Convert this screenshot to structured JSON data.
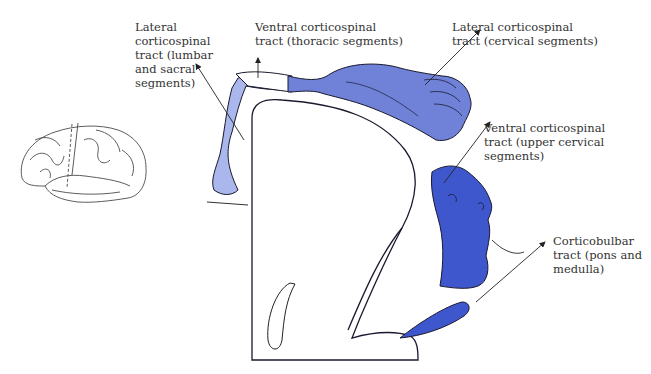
{
  "diagram": {
    "colors": {
      "light_blue": "#a9b7ec",
      "mid_blue": "#6f82d8",
      "deep_blue": "#3f57cc",
      "outline": "#1a1a2e",
      "text": "#333333"
    },
    "labels": [
      {
        "id": "lateral-cs-lumbar",
        "lines": [
          "Lateral",
          "corticospinal",
          "tract (lumbar",
          "and sacral",
          "segments)"
        ]
      },
      {
        "id": "ventral-cs-thoracic",
        "lines": [
          "Ventral corticospinal",
          "tract (thoracic segments)"
        ]
      },
      {
        "id": "lateral-cs-cervical",
        "lines": [
          "Lateral corticospinal",
          "tract (cervical segments)"
        ]
      },
      {
        "id": "ventral-cs-upper-cervical",
        "lines": [
          "Ventral corticospinal",
          "tract (upper cervical",
          "segments)"
        ]
      },
      {
        "id": "corticobulbar",
        "lines": [
          "Corticobulbar",
          "tract (pons and",
          "medulla)"
        ]
      }
    ]
  },
  "text": {
    "l1": "Lateral\ncorticospinal\ntract (lumbar\nand sacral\nsegments)",
    "l2": "Ventral corticospinal\ntract (thoracic segments)",
    "l3": "Lateral corticospinal\ntract (cervical segments)",
    "l4": "Ventral corticospinal\ntract (upper cervical\nsegments)",
    "l5": "Corticobulbar\ntract (pons and\nmedulla)"
  }
}
